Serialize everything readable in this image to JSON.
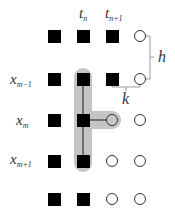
{
  "diagram": {
    "type": "finite-difference-stencil-grid",
    "column_labels": [
      {
        "base": "t",
        "sub": "n"
      },
      {
        "base": "t",
        "sub": "n+1"
      }
    ],
    "row_labels": [
      {
        "base": "x",
        "sub": "m−1"
      },
      {
        "base": "x",
        "sub": "m"
      },
      {
        "base": "x",
        "sub": "m+1"
      }
    ],
    "spacing_labels": {
      "h": "h",
      "k": "k"
    },
    "grid": {
      "columns_x": [
        54,
        83,
        112,
        140
      ],
      "rows_y": [
        36,
        79,
        120,
        161,
        199
      ],
      "nodes": [
        [
          "square",
          "square",
          "square",
          "circle"
        ],
        [
          "square",
          "square",
          "square",
          "circle"
        ],
        [
          "square",
          "square",
          "filled-circle",
          "circle"
        ],
        [
          "square",
          "square",
          "circle",
          "circle"
        ],
        [
          "square",
          "square",
          "circle",
          "circle"
        ]
      ]
    },
    "stencil": {
      "vertical": {
        "column": 1,
        "from_row": 1,
        "to_row": 3
      },
      "horizontal": {
        "row": 2,
        "from_col": 1,
        "to_col": 2
      },
      "highlight_color": "#bdbdbd",
      "line_color": "#555555"
    }
  }
}
